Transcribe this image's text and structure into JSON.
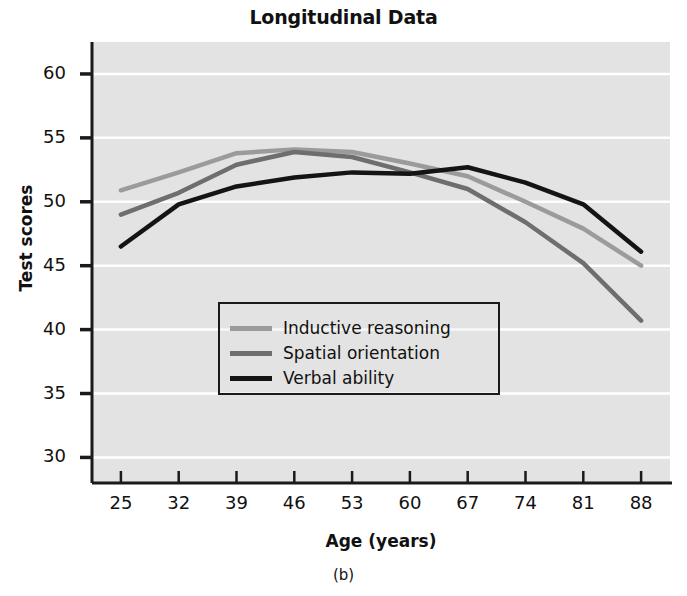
{
  "figure": {
    "title": "Longitudinal Data",
    "caption": "(b)",
    "background_color": "#e3e3e3",
    "gridline_color": "#ffffff",
    "axis_color": "#1a1a1a"
  },
  "chart_data": {
    "type": "line",
    "title": "Longitudinal Data",
    "xlabel": "Age (years)",
    "ylabel": "Test scores",
    "categories": [
      25,
      32,
      39,
      46,
      53,
      60,
      67,
      74,
      81,
      88
    ],
    "x": [
      25,
      32,
      39,
      46,
      53,
      60,
      67,
      74,
      81,
      88
    ],
    "xlim": [
      21.5,
      91.5
    ],
    "ylim": [
      28.0,
      62.5
    ],
    "xticks": [
      "25",
      "32",
      "39",
      "46",
      "53",
      "60",
      "67",
      "74",
      "81",
      "88"
    ],
    "yticks": [
      "30",
      "35",
      "40",
      "45",
      "50",
      "55",
      "60"
    ],
    "grid": true,
    "legend_position": "center",
    "series": [
      {
        "name": "Inductive reasoning",
        "color": "#9b9b9b",
        "values": [
          50.9,
          52.3,
          53.8,
          54.1,
          53.9,
          53.0,
          52.0,
          50.0,
          47.9,
          45.0
        ]
      },
      {
        "name": "Spatial orientation",
        "color": "#6e6e6e",
        "values": [
          49.0,
          50.7,
          52.9,
          53.9,
          53.5,
          52.3,
          51.0,
          48.4,
          45.2,
          40.7
        ]
      },
      {
        "name": "Verbal ability",
        "color": "#141414",
        "values": [
          46.5,
          49.8,
          51.2,
          51.9,
          52.3,
          52.2,
          52.7,
          51.5,
          49.8,
          46.1
        ]
      }
    ]
  },
  "legend": {
    "items": [
      {
        "label": "Inductive reasoning",
        "color": "#9b9b9b"
      },
      {
        "label": "Spatial orientation",
        "color": "#6e6e6e"
      },
      {
        "label": "Verbal ability",
        "color": "#141414"
      }
    ]
  }
}
